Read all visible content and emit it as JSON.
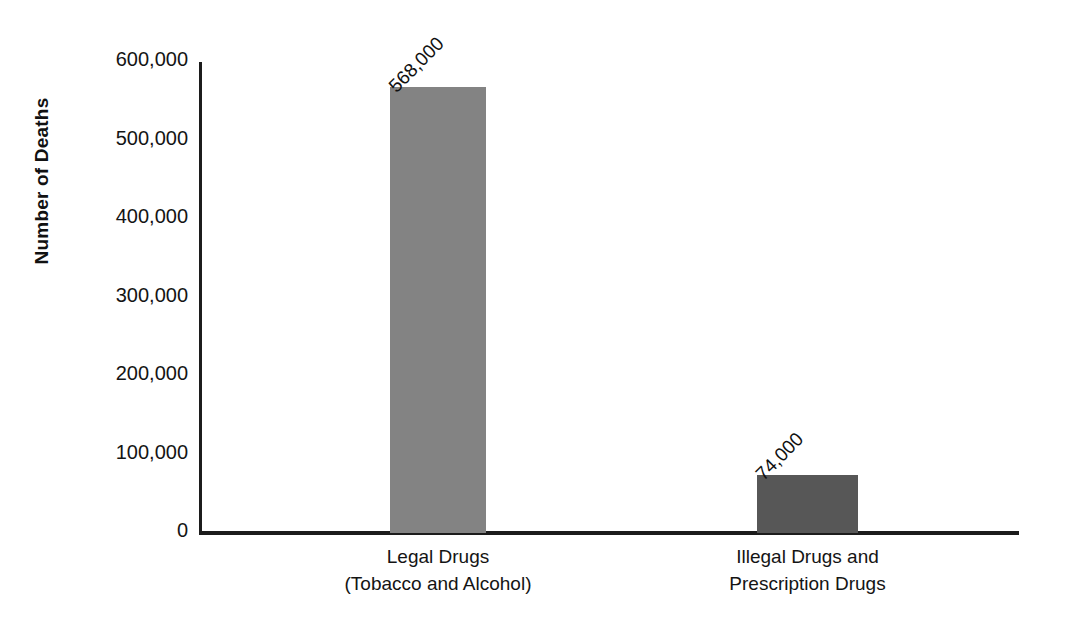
{
  "chart_data": {
    "type": "bar",
    "title": "",
    "xlabel": "",
    "ylabel": "Number of Deaths",
    "categories": [
      "Legal Drugs (Tobacco and Alcohol)",
      "Illegal Drugs and Prescription Drugs"
    ],
    "category_lines": [
      [
        "Legal Drugs",
        "(Tobacco and Alcohol)"
      ],
      [
        "Illegal Drugs and",
        "Prescription Drugs"
      ]
    ],
    "values": [
      568000,
      74000
    ],
    "value_labels": [
      "568,000",
      "74,000"
    ],
    "bar_colors": [
      "#838383",
      "#575757"
    ],
    "ylim": [
      0,
      600000
    ],
    "ytick_values": [
      600000,
      500000,
      400000,
      300000,
      200000,
      100000,
      0
    ],
    "ytick_labels": [
      "600,000",
      "500,000",
      "400,000",
      "300,000",
      "200,000",
      "100,000",
      "0"
    ],
    "grid": false,
    "legend": "none",
    "axis_color": "#1c1c1c",
    "background": "#ffffff"
  }
}
